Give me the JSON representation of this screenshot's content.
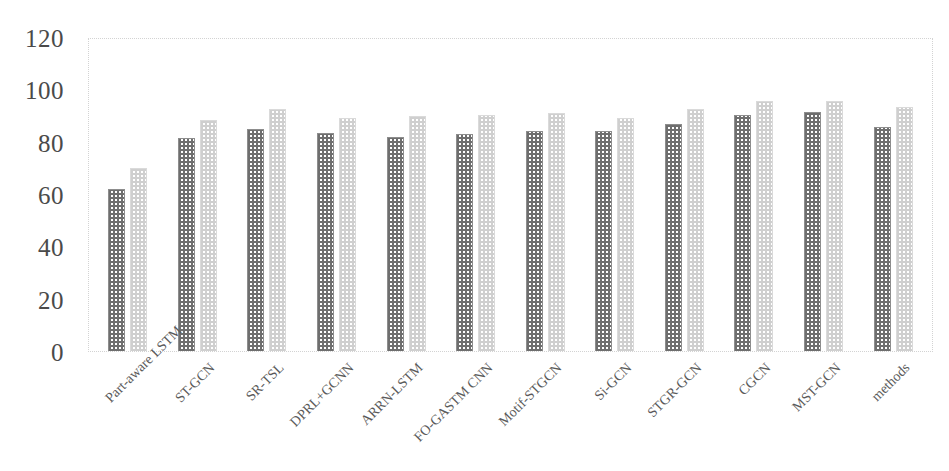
{
  "chart_data": {
    "type": "bar",
    "title": "",
    "xlabel": "methods",
    "ylabel": "",
    "ylim": [
      0,
      120
    ],
    "yticks": [
      0,
      20,
      40,
      60,
      80,
      100,
      120
    ],
    "grid": false,
    "legend": "none",
    "categories": [
      "Part-aware LSTM",
      "ST-GCN",
      "SR-TSL",
      "DPRL+GCNN",
      "ARRN-LSTM",
      "FO-GASTM CNN",
      "Motif-STGCN",
      "Si-GCN",
      "STGR-GCN",
      "CGCN",
      "MST-GCN",
      "methods"
    ],
    "series": [
      {
        "name": "series-1",
        "color": "#6e6e6e",
        "values": [
          62.0,
          81.5,
          84.8,
          83.5,
          81.8,
          83.0,
          84.2,
          84.2,
          86.9,
          90.3,
          91.5,
          85.8
        ]
      },
      {
        "name": "series-2",
        "color": "#cfcfcf",
        "values": [
          70.0,
          88.3,
          92.4,
          89.2,
          89.8,
          90.1,
          90.8,
          89.0,
          92.3,
          95.5,
          95.4,
          93.2
        ]
      }
    ]
  },
  "axes": {
    "y_tick_labels": [
      "120",
      "100",
      "80",
      "60",
      "40",
      "20",
      "0"
    ]
  }
}
